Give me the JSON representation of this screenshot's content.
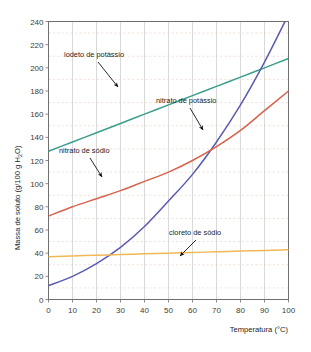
{
  "chart_data": {
    "type": "line",
    "title": "",
    "xlabel": "Temperatura (°C)",
    "ylabel": "Massa de soluto (g/100 g H2O)",
    "ylabel_display": "Massa de soluto (g/100 g H",
    "ylabel_sub": "2",
    "ylabel_tail": "O)",
    "xlim": [
      0,
      100
    ],
    "ylim": [
      0,
      240
    ],
    "xticks": [
      0,
      10,
      20,
      30,
      40,
      50,
      60,
      70,
      80,
      90,
      100
    ],
    "yticks": [
      0,
      20,
      40,
      60,
      80,
      100,
      120,
      140,
      160,
      180,
      200,
      220,
      240
    ],
    "ytick_labels": [
      "0",
      "20",
      "40",
      "60",
      "80",
      "100",
      "120",
      "140",
      "160",
      "180",
      "200",
      "220",
      "240"
    ],
    "xtick_labels": [
      "0",
      "10",
      "20",
      "30",
      "40",
      "50",
      "60",
      "70",
      "80",
      "90",
      "100"
    ],
    "grid": "vertical major solid, horizontal minor dashed",
    "legend_position": "inline annotations with arrows",
    "x": [
      0,
      10,
      20,
      30,
      40,
      50,
      60,
      70,
      80,
      90,
      100
    ],
    "series": [
      {
        "name": "iodeto de potássio",
        "color": "#3a9e8c",
        "values": [
          128,
          136,
          144,
          152,
          160,
          168,
          176,
          184,
          192,
          200,
          208
        ],
        "label_text": "iodeto de potássio",
        "label_x": 64,
        "label_y": 57,
        "arrow_from_x": 98,
        "arrow_from_y": 62,
        "arrow_to_x": 118,
        "arrow_to_y": 87
      },
      {
        "name": "nitrato de potássio",
        "color": "#5a5ab2",
        "values": [
          12,
          20,
          31,
          45,
          63,
          85,
          108,
          136,
          168,
          205,
          246
        ],
        "label_text": "nitrato de potássio",
        "label_x": 156,
        "label_y": 103,
        "arrow_from_x": 190,
        "arrow_from_y": 108,
        "arrow_to_x": 203,
        "arrow_to_y": 130
      },
      {
        "name": "nitrato de sódio",
        "color": "#d8624b",
        "values": [
          72,
          80,
          87,
          94,
          102,
          110,
          120,
          132,
          146,
          163,
          180
        ],
        "label_text": "nitrato de sódio",
        "label_x": 59,
        "label_y": 153,
        "arrow_from_x": 90,
        "arrow_from_y": 158,
        "arrow_to_x": 102,
        "arrow_to_y": 177
      },
      {
        "name": "cloreto de sódio",
        "color": "#f0b855",
        "values": [
          37,
          37.6,
          38.2,
          38.8,
          39.4,
          40,
          40.6,
          41.2,
          41.8,
          42.4,
          43
        ],
        "label_text": "cloreto de sódio",
        "label_x": 169,
        "label_y": 235,
        "arrow_from_x": 196,
        "arrow_from_y": 240,
        "arrow_to_x": 180,
        "arrow_to_y": 256
      }
    ]
  }
}
